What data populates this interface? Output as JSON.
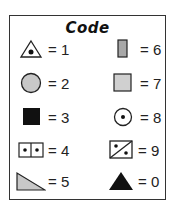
{
  "legend": {
    "title": "Code",
    "items": [
      {
        "icon": "triangle-with-dot-icon",
        "label": "= 1"
      },
      {
        "icon": "gray-circle-icon",
        "label": "= 2"
      },
      {
        "icon": "black-square-icon",
        "label": "= 3"
      },
      {
        "icon": "two-dot-box-icon",
        "label": "= 4"
      },
      {
        "icon": "gray-right-triangle-icon",
        "label": "= 5"
      },
      {
        "icon": "gray-rectangle-icon",
        "label": "= 6"
      },
      {
        "icon": "gray-square-icon",
        "label": "= 7"
      },
      {
        "icon": "circle-with-dot-icon",
        "label": "= 8"
      },
      {
        "icon": "diagonal-box-icon",
        "label": "= 9"
      },
      {
        "icon": "black-triangle-icon",
        "label": "= 0"
      }
    ],
    "colors": {
      "fill_gray": "#c8c8c8",
      "fill_dark": "#111111",
      "stroke": "#222222"
    }
  }
}
